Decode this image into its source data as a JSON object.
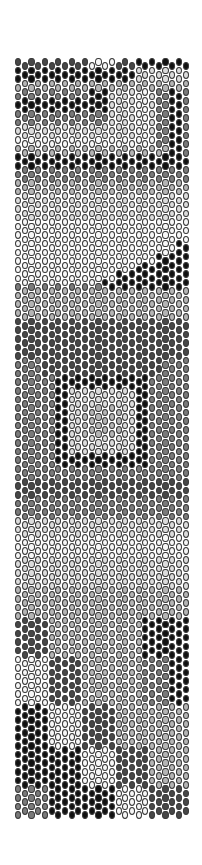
{
  "pattern": {
    "type": "peyote-bead-pattern",
    "columns": 26,
    "bead_pitch_x": 6.7,
    "bead_pitch_y": 8.66,
    "width_px": 174,
    "height_px": 762,
    "palette": {
      "black": "#111111",
      "dark": "#474747",
      "mid": "#7a7a7a",
      "light": "#b5b5b5",
      "pale": "#dcdcdc",
      "white": "#f7f7f7"
    },
    "background": "mid",
    "regions": [
      {
        "c0": 0,
        "c1": 25,
        "y0": 0,
        "y1": 10,
        "color": "dark"
      },
      {
        "c0": 11,
        "c1": 14,
        "y0": 0,
        "y1": 10,
        "color": "white"
      },
      {
        "c0": 18,
        "c1": 25,
        "y0": 0,
        "y1": 10,
        "color": "black"
      },
      {
        "c0": 0,
        "c1": 17,
        "y0": 10,
        "y1": 22,
        "color": "black"
      },
      {
        "c0": 18,
        "c1": 25,
        "y0": 10,
        "y1": 22,
        "color": "pale"
      },
      {
        "c0": 0,
        "c1": 25,
        "y0": 22,
        "y1": 32,
        "color": "light"
      },
      {
        "c0": 0,
        "c1": 10,
        "y0": 32,
        "y1": 50,
        "color": "mid"
      },
      {
        "c0": 11,
        "c1": 13,
        "y0": 32,
        "y1": 50,
        "color": "black"
      },
      {
        "c0": 0,
        "c1": 13,
        "y0": 42,
        "y1": 54,
        "color": "black"
      },
      {
        "c0": 14,
        "c1": 20,
        "y0": 32,
        "y1": 95,
        "color": "pale"
      },
      {
        "c0": 18,
        "c1": 19,
        "y0": 32,
        "y1": 95,
        "color": "white"
      },
      {
        "c0": 21,
        "c1": 22,
        "y0": 32,
        "y1": 95,
        "color": "mid"
      },
      {
        "c0": 23,
        "c1": 24,
        "y0": 32,
        "y1": 110,
        "color": "black"
      },
      {
        "c0": 25,
        "c1": 25,
        "y0": 32,
        "y1": 110,
        "color": "mid"
      },
      {
        "c0": 0,
        "c1": 13,
        "y0": 54,
        "y1": 68,
        "color": "mid"
      },
      {
        "c0": 0,
        "c1": 13,
        "y0": 68,
        "y1": 88,
        "color": "pale"
      },
      {
        "c0": 0,
        "c1": 20,
        "y0": 80,
        "y1": 88,
        "color": "white"
      },
      {
        "c0": 0,
        "c1": 22,
        "y0": 88,
        "y1": 97,
        "color": "light"
      },
      {
        "c0": 0,
        "c1": 25,
        "y0": 97,
        "y1": 110,
        "color": "black"
      },
      {
        "c0": 0,
        "c1": 25,
        "y0": 110,
        "y1": 122,
        "color": "mid"
      },
      {
        "c0": 0,
        "c1": 25,
        "y0": 122,
        "y1": 135,
        "color": "light"
      },
      {
        "c0": 0,
        "c1": 25,
        "y0": 135,
        "y1": 160,
        "color": "pale"
      },
      {
        "c0": 0,
        "c1": 25,
        "y0": 160,
        "y1": 225,
        "color": "white"
      },
      {
        "c0": 24,
        "c1": 25,
        "y0": 185,
        "y1": 225,
        "color": "black"
      },
      {
        "c0": 21,
        "c1": 25,
        "y0": 195,
        "y1": 225,
        "color": "black"
      },
      {
        "c0": 18,
        "c1": 25,
        "y0": 205,
        "y1": 225,
        "color": "black"
      },
      {
        "c0": 15,
        "c1": 25,
        "y0": 215,
        "y1": 225,
        "color": "black"
      },
      {
        "c0": 13,
        "c1": 25,
        "y0": 222,
        "y1": 230,
        "color": "black"
      },
      {
        "c0": 0,
        "c1": 25,
        "y0": 230,
        "y1": 262,
        "color": "light"
      },
      {
        "c0": 0,
        "c1": 25,
        "y0": 262,
        "y1": 300,
        "color": "dark"
      },
      {
        "c0": 0,
        "c1": 25,
        "y0": 300,
        "y1": 318,
        "color": "mid"
      },
      {
        "c0": 4,
        "c1": 21,
        "y0": 300,
        "y1": 318,
        "color": "dark"
      },
      {
        "c0": 2,
        "c1": 23,
        "y0": 318,
        "y1": 420,
        "color": "mid"
      },
      {
        "c0": 6,
        "c1": 19,
        "y0": 320,
        "y1": 408,
        "color": "black"
      },
      {
        "c0": 8,
        "c1": 17,
        "y0": 332,
        "y1": 398,
        "color": "pale"
      },
      {
        "c0": 10,
        "c1": 15,
        "y0": 350,
        "y1": 380,
        "color": "light"
      },
      {
        "c0": 0,
        "c1": 25,
        "y0": 420,
        "y1": 440,
        "color": "dark"
      },
      {
        "c0": 0,
        "c1": 25,
        "y0": 440,
        "y1": 460,
        "color": "mid"
      },
      {
        "c0": 0,
        "c1": 25,
        "y0": 460,
        "y1": 530,
        "color": "pale"
      },
      {
        "c0": 0,
        "c1": 25,
        "y0": 480,
        "y1": 500,
        "color": "white"
      },
      {
        "c0": 0,
        "c1": 25,
        "y0": 530,
        "y1": 560,
        "color": "light"
      },
      {
        "c0": 0,
        "c1": 25,
        "y0": 560,
        "y1": 600,
        "color": "mid"
      },
      {
        "c0": 0,
        "c1": 4,
        "y0": 560,
        "y1": 600,
        "color": "dark"
      },
      {
        "c0": 5,
        "c1": 18,
        "y0": 560,
        "y1": 600,
        "color": "light"
      },
      {
        "c0": 19,
        "c1": 25,
        "y0": 560,
        "y1": 600,
        "color": "black"
      },
      {
        "c0": 0,
        "c1": 4,
        "y0": 600,
        "y1": 648,
        "color": "white"
      },
      {
        "c0": 5,
        "c1": 9,
        "y0": 600,
        "y1": 648,
        "color": "dark"
      },
      {
        "c0": 10,
        "c1": 18,
        "y0": 600,
        "y1": 648,
        "color": "light"
      },
      {
        "c0": 19,
        "c1": 22,
        "y0": 600,
        "y1": 648,
        "color": "mid"
      },
      {
        "c0": 23,
        "c1": 25,
        "y0": 600,
        "y1": 648,
        "color": "black"
      },
      {
        "c0": 0,
        "c1": 4,
        "y0": 648,
        "y1": 690,
        "color": "black"
      },
      {
        "c0": 5,
        "c1": 9,
        "y0": 648,
        "y1": 690,
        "color": "white"
      },
      {
        "c0": 10,
        "c1": 14,
        "y0": 648,
        "y1": 690,
        "color": "dark"
      },
      {
        "c0": 15,
        "c1": 25,
        "y0": 648,
        "y1": 690,
        "color": "light"
      },
      {
        "c0": 0,
        "c1": 9,
        "y0": 690,
        "y1": 730,
        "color": "black"
      },
      {
        "c0": 10,
        "c1": 14,
        "y0": 690,
        "y1": 730,
        "color": "white"
      },
      {
        "c0": 15,
        "c1": 19,
        "y0": 690,
        "y1": 730,
        "color": "dark"
      },
      {
        "c0": 20,
        "c1": 25,
        "y0": 690,
        "y1": 730,
        "color": "light"
      },
      {
        "c0": 0,
        "c1": 4,
        "y0": 730,
        "y1": 762,
        "color": "mid"
      },
      {
        "c0": 5,
        "c1": 14,
        "y0": 730,
        "y1": 762,
        "color": "black"
      },
      {
        "c0": 15,
        "c1": 19,
        "y0": 730,
        "y1": 762,
        "color": "white"
      },
      {
        "c0": 20,
        "c1": 25,
        "y0": 730,
        "y1": 762,
        "color": "dark"
      }
    ]
  }
}
